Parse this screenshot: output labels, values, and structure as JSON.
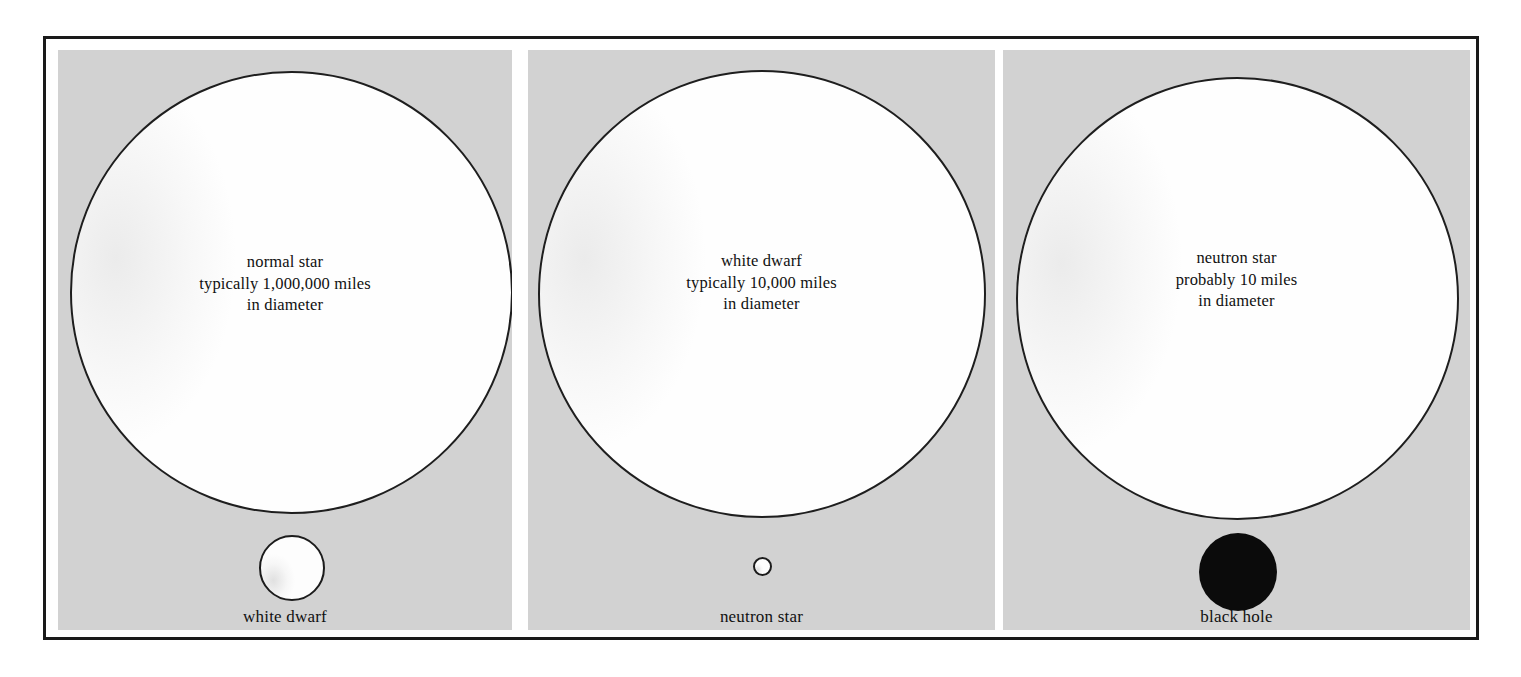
{
  "figure": {
    "type": "stellar-remnant-size-comparison-diagram",
    "background_color": "#ffffff",
    "frame_color": "#1a1a1a",
    "panel_background_color": "#d2d2d2",
    "circle_fill_color": "#fefefe",
    "circle_stroke_color": "#1e1e1e",
    "black_hole_color": "#0b0b0b"
  },
  "panels": [
    {
      "id": "normal-star",
      "main_body": {
        "name": "normal star",
        "caption_lines": [
          "normal star",
          "typically 1,000,000 miles",
          "in diameter"
        ],
        "diameter_text": "1,000,000 miles",
        "qualifier": "typically"
      },
      "small_body": {
        "name": "white dwarf",
        "label": "white dwarf",
        "style": "outlined"
      }
    },
    {
      "id": "white-dwarf",
      "main_body": {
        "name": "white dwarf",
        "caption_lines": [
          "white dwarf",
          "typically 10,000 miles",
          "in diameter"
        ],
        "diameter_text": "10,000 miles",
        "qualifier": "typically"
      },
      "small_body": {
        "name": "neutron star",
        "label": "neutron star",
        "style": "outlined"
      }
    },
    {
      "id": "neutron-star",
      "main_body": {
        "name": "neutron star",
        "caption_lines": [
          "neutron star",
          "probably 10 miles",
          "in diameter"
        ],
        "diameter_text": "10 miles",
        "qualifier": "probably"
      },
      "small_body": {
        "name": "black hole",
        "label": "black hole",
        "style": "filled"
      }
    }
  ]
}
